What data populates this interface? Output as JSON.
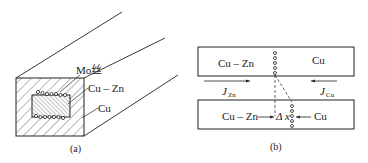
{
  "panel_a": {
    "caption": "(a)",
    "labels": {
      "mo_wire": "Mo丝",
      "cu_zn": "Cu – Zn",
      "cu": "Cu"
    }
  },
  "panel_b": {
    "caption": "(b)",
    "top_bar": {
      "left_label": "Cu – Zn",
      "right_label": "Cu"
    },
    "flux": {
      "left": {
        "symbol": "J",
        "subscript": "Zn"
      },
      "right": {
        "symbol": "J",
        "subscript": "Cu"
      }
    },
    "bottom_bar": {
      "left_label": "Cu – Zn",
      "shift_label": "Δ x",
      "right_label": "Cu"
    }
  }
}
